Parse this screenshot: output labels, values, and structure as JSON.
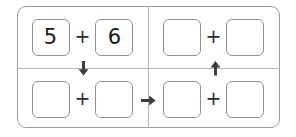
{
  "worksheet": {
    "type": "fact-family-diagram",
    "operator": "+",
    "quadrants": [
      {
        "id": "top-left",
        "position": "top-left",
        "operand_left": "5",
        "operand_right": "6",
        "filled": true
      },
      {
        "id": "top-right",
        "position": "top-right",
        "operand_left": "",
        "operand_right": "",
        "filled": false
      },
      {
        "id": "bottom-left",
        "position": "bottom-left",
        "operand_left": "",
        "operand_right": "",
        "filled": false
      },
      {
        "id": "bottom-right",
        "position": "bottom-right",
        "operand_left": "",
        "operand_right": "",
        "filled": false
      }
    ],
    "arrows": [
      {
        "id": "down",
        "direction": "down",
        "glyph": "arrow-down-icon"
      },
      {
        "id": "up",
        "direction": "up",
        "glyph": "arrow-up-icon"
      },
      {
        "id": "right",
        "direction": "right",
        "glyph": "arrow-right-icon"
      }
    ],
    "colors": {
      "frame_border": "#9b9b9b",
      "divider": "#b5b5b5",
      "box_border": "#8f8f8f",
      "text": "#1a1a1a",
      "arrow": "#3d3d3d",
      "background": "#ffffff"
    }
  }
}
